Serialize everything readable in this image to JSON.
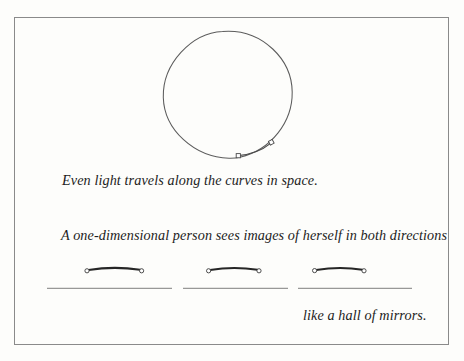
{
  "figure": {
    "background_color": "#fdfdfb",
    "ink_color": "#1c1c1c",
    "line_color": "#6f6f6f",
    "frame": {
      "name": "page-border",
      "stroke_color": "#8a8a8a",
      "x": 14,
      "y": 17,
      "width": 435,
      "height": 328
    },
    "circle": {
      "name": "great-circle",
      "center_x": 228,
      "center_y": 95,
      "radius": 64,
      "stroke_color": "#5c5c5c"
    },
    "light_path": {
      "name": "light-ray-arc",
      "description": "arc of light travelling along the curve of space inside the circle",
      "start_x": 238,
      "start_y": 156,
      "end_x": 272,
      "end_y": 142,
      "stroke_color": "#4a4a4a"
    },
    "endpoint_markers": [
      {
        "name": "ray-start-marker",
        "x": 238,
        "y": 156
      },
      {
        "name": "ray-end-marker",
        "x": 272,
        "y": 142
      }
    ],
    "mirrors": [
      {
        "name": "mirror-bar-left",
        "x1": 86,
        "x2": 142,
        "y": 270
      },
      {
        "name": "mirror-bar-center",
        "x1": 208,
        "x2": 259,
        "y": 270
      },
      {
        "name": "mirror-bar-right",
        "x1": 314,
        "x2": 364,
        "y": 270
      }
    ],
    "ground_lines": [
      {
        "name": "ground-line-left",
        "x1": 47,
        "x2": 172,
        "y": 288
      },
      {
        "name": "ground-line-center",
        "x1": 183,
        "x2": 288,
        "y": 288
      },
      {
        "name": "ground-line-right",
        "x1": 298,
        "x2": 412,
        "y": 288
      }
    ]
  },
  "captions": {
    "line_1": "Even light travels along the curves in space.",
    "line_2": "A one-dimensional person sees images of herself in both directions",
    "line_3": "like a hall of mirrors."
  }
}
